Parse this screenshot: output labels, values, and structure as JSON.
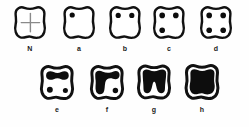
{
  "figure": {
    "rows": [
      {
        "name": "row-1",
        "cells": [
          {
            "id": "stage-n",
            "label": "N",
            "marking": "crosshair",
            "description": "Normal tooth outline with faint gray crosshair fissure lines",
            "dots": 0,
            "fill_percent": 0
          },
          {
            "id": "stage-a",
            "label": "a",
            "marking": "one-dot",
            "description": "One small filled dot at upper left",
            "dots": 1,
            "fill_percent": 3
          },
          {
            "id": "stage-b",
            "label": "b",
            "marking": "two-dots",
            "description": "Two filled dots along the top",
            "dots": 2,
            "fill_percent": 6
          },
          {
            "id": "stage-c",
            "label": "c",
            "marking": "three-dots",
            "description": "Two dots at top plus one dot at lower left",
            "dots": 3,
            "fill_percent": 9
          },
          {
            "id": "stage-d",
            "label": "d",
            "marking": "four-dots",
            "description": "Four filled dots, two top and two bottom",
            "dots": 4,
            "fill_percent": 12
          }
        ]
      },
      {
        "name": "row-2",
        "cells": [
          {
            "id": "stage-e",
            "label": "e",
            "marking": "horizontal-bar-two-dots",
            "description": "Thick horizontal bar joining the two upper spots, two dots below",
            "dots": 2,
            "fill_percent": 30
          },
          {
            "id": "stage-f",
            "label": "f",
            "marking": "l-shaped-mass-one-dot",
            "description": "Large L-shaped filled mass across top and down the left side, one dot lower right",
            "dots": 1,
            "fill_percent": 50
          },
          {
            "id": "stage-g",
            "label": "g",
            "marking": "near-full-with-notch",
            "description": "Almost entirely filled with a narrow notch at bottom centre",
            "dots": 0,
            "fill_percent": 85
          },
          {
            "id": "stage-h",
            "label": "h",
            "marking": "fully-filled",
            "description": "Entire occlusal surface filled solid black",
            "dots": 0,
            "fill_percent": 100
          }
        ]
      }
    ],
    "colors": {
      "outline": "#111111",
      "fill": "#0d0d0d",
      "interior": "#ffffff",
      "fissure": "#8a8a8a",
      "background": "#fefefe",
      "caption": "#1a1a1a"
    }
  }
}
